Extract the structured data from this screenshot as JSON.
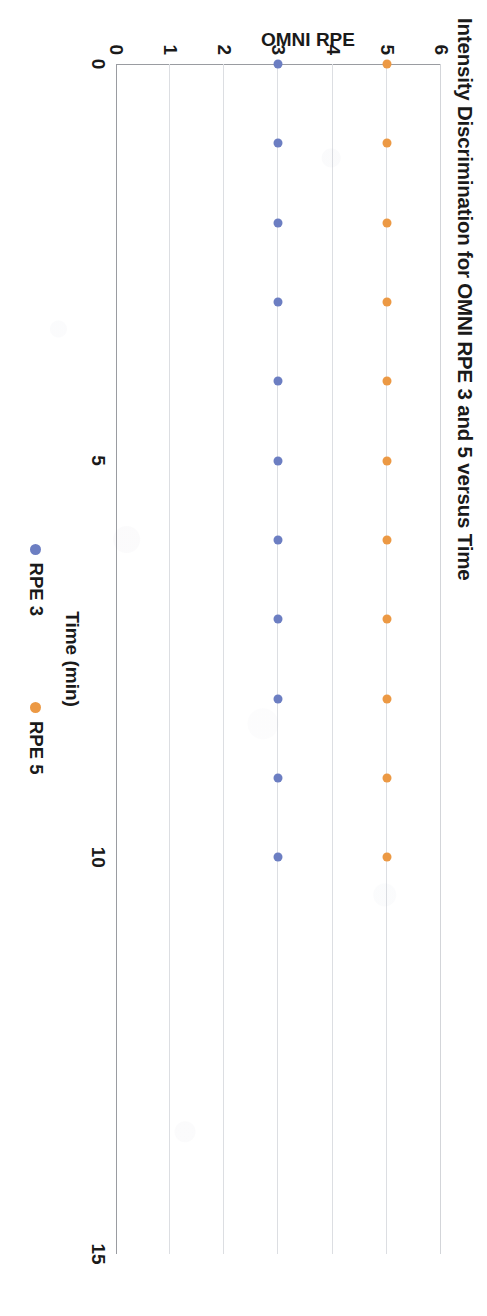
{
  "chart_data": {
    "type": "scatter",
    "title": "Intensity Discrimination for OMNI RPE 3 and 5 versus Time",
    "xlabel": "Time (min)",
    "ylabel": "OMNI RPE",
    "xlim": [
      0,
      15
    ],
    "ylim": [
      0,
      6
    ],
    "xticks": [
      0,
      5,
      10,
      15
    ],
    "xtick_labels": [
      "0",
      "5",
      "10",
      "15"
    ],
    "yticks": [
      0,
      1,
      2,
      3,
      4,
      5,
      6
    ],
    "ytick_labels": [
      "0",
      "1",
      "2",
      "3",
      "4",
      "5",
      "6"
    ],
    "grid": "horizontal",
    "legend_position": "bottom",
    "x": [
      0,
      1,
      2,
      3,
      4,
      5,
      6,
      7,
      8,
      9,
      10
    ],
    "series": [
      {
        "name": "RPE 3",
        "color": "#6c7ec2",
        "values": [
          3,
          3,
          3,
          3,
          3,
          3,
          3,
          3,
          3,
          3,
          3
        ]
      },
      {
        "name": "RPE 5",
        "color": "#ec9944",
        "values": [
          5,
          5,
          5,
          5,
          5,
          5,
          5,
          5,
          5,
          5,
          5
        ]
      }
    ]
  },
  "colors": {
    "rpe3": "#6c7ec2",
    "rpe5": "#ec9944",
    "gridline": "#d3d5d9",
    "axis": "#9a9ca1",
    "text": "#1a1a1a"
  },
  "legend": {
    "items": [
      {
        "label": "RPE 3",
        "swatch": "rpe3"
      },
      {
        "label": "RPE 5",
        "swatch": "rpe5"
      }
    ]
  }
}
